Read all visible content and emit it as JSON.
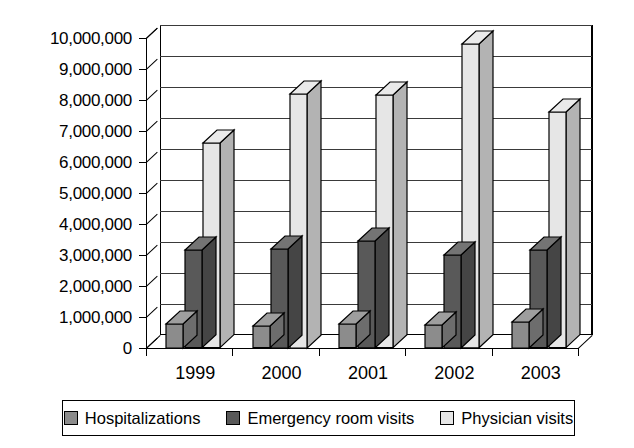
{
  "chart_data": {
    "type": "bar",
    "title": "",
    "subtitle": "",
    "xlabel": "",
    "ylabel": "",
    "categories": [
      "1999",
      "2000",
      "2001",
      "2002",
      "2003"
    ],
    "series": [
      {
        "name": "Hospitalizations",
        "color": "#8c8c8c",
        "values": [
          780000,
          700000,
          760000,
          740000,
          840000
        ]
      },
      {
        "name": "Emergency room visits",
        "color": "#595959",
        "values": [
          3150000,
          3200000,
          3450000,
          3000000,
          3150000
        ]
      },
      {
        "name": "Physician visits",
        "color": "#e6e6e6",
        "values": [
          6600000,
          8200000,
          8150000,
          9800000,
          7600000
        ]
      }
    ],
    "ylim": [
      0,
      10000000
    ],
    "ytick_step": 1000000,
    "ytick_labels": [
      "0",
      "1,000,000",
      "2,000,000",
      "3,000,000",
      "4,000,000",
      "5,000,000",
      "6,000,000",
      "7,000,000",
      "8,000,000",
      "9,000,000",
      "10,000,000"
    ],
    "grid": true,
    "grid_axis": "y",
    "legend_position": "bottom",
    "style": "3d-column",
    "plot_background": "#ffffff"
  },
  "legend": {
    "items": [
      {
        "label": "Hospitalizations",
        "color": "#8c8c8c"
      },
      {
        "label": "Emergency room visits",
        "color": "#595959"
      },
      {
        "label": "Physician visits",
        "color": "#e6e6e6"
      }
    ]
  }
}
